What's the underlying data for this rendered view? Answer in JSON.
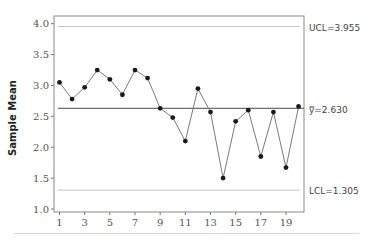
{
  "chart_data": {
    "type": "line",
    "title": "",
    "xlabel": "",
    "ylabel": "Sample Mean",
    "x": [
      1,
      2,
      3,
      4,
      5,
      6,
      7,
      8,
      9,
      10,
      11,
      12,
      13,
      14,
      15,
      16,
      17,
      18,
      19,
      20
    ],
    "series": [
      {
        "name": "Sample Mean",
        "values": [
          3.05,
          2.78,
          2.97,
          3.25,
          3.1,
          2.85,
          3.25,
          3.12,
          2.63,
          2.48,
          2.1,
          2.95,
          2.57,
          1.5,
          2.42,
          2.6,
          1.85,
          2.57,
          1.67,
          2.66
        ]
      }
    ],
    "xticks": [
      1,
      3,
      5,
      7,
      9,
      11,
      13,
      15,
      17,
      19
    ],
    "yticks": [
      "1.0",
      "1.5",
      "2.0",
      "2.5",
      "3.0",
      "3.5",
      "4.0"
    ],
    "ylim": [
      1.0,
      4.05
    ],
    "xlim": [
      0.5,
      20.5
    ],
    "grid": false,
    "reference_lines": [
      {
        "name": "UCL",
        "value": 3.955,
        "label": "UCL=3.955"
      },
      {
        "name": "center",
        "value": 2.63,
        "label": "y̿=2.630"
      },
      {
        "name": "LCL",
        "value": 1.305,
        "label": "LCL=1.305"
      }
    ]
  },
  "labels": {
    "ylabel": "Sample Mean",
    "ucl": "UCL=3.955",
    "center": "y̿=2.630",
    "lcl": "LCL=1.305"
  }
}
